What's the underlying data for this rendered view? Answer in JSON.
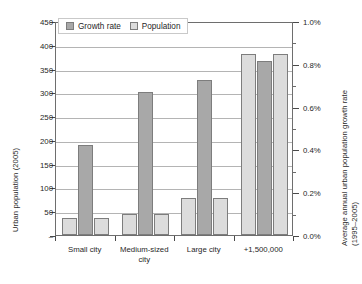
{
  "chart_data": {
    "type": "bar",
    "title": "",
    "categories": [
      "Small city",
      "Medium-sized city",
      "Large city",
      "+1,500,000"
    ],
    "category_labels_wrapped": [
      [
        "Small city"
      ],
      [
        "Medium-sized",
        "city"
      ],
      [
        "Large city"
      ],
      [
        "+1,500,000"
      ]
    ],
    "series": [
      {
        "name": "Population",
        "axis": "left",
        "unit": "Urban population (2005)",
        "color": "#dcdcdc",
        "values": [
          35,
          45,
          78,
          380
        ]
      },
      {
        "name": "Growth rate",
        "axis": "right",
        "unit": "Average annual urban population growth rate (1995-2005)",
        "color": "#a8a8a8",
        "values_population_scale": [
          190,
          300,
          325,
          365
        ],
        "values": [
          0.42,
          0.67,
          0.72,
          0.81
        ]
      }
    ],
    "bar_order_per_group": [
      "Population",
      "Growth rate",
      "Population"
    ],
    "xlabel": "",
    "ylabel_left": "Urban population (2005)",
    "ylabel_right_line1": "Average annual urban population growth rate",
    "ylabel_right_line2": "(1995–2005)",
    "ylim_left": [
      0,
      450
    ],
    "ylim_right": [
      0.0,
      1.0
    ],
    "ytick_left_labels": [
      "450",
      "400",
      "350",
      "300",
      "250",
      "200",
      "150",
      "100",
      "50",
      "–"
    ],
    "ytick_left_values": [
      450,
      400,
      350,
      300,
      250,
      200,
      150,
      100,
      50,
      0
    ],
    "ytick_right_labels": [
      "1.0%",
      "0.8%",
      "0.6%",
      "0.4%",
      "0.2%",
      "0.0%"
    ],
    "ytick_right_values": [
      1.0,
      0.8,
      0.6,
      0.4,
      0.2,
      0.0
    ],
    "grid": true,
    "legend_position": "top-left-inside",
    "legend_entries": [
      {
        "label": "Growth rate",
        "color": "#a8a8a8"
      },
      {
        "label": "Population",
        "color": "#dcdcdc"
      }
    ]
  },
  "colors": {
    "population": "#dcdcdc",
    "growth_rate": "#a8a8a8",
    "bar_border": "#7d7d7d",
    "gridline": "#b4b4b4",
    "axis": "#6e6e6e",
    "text": "#1f1f1f",
    "background": "#ffffff"
  }
}
